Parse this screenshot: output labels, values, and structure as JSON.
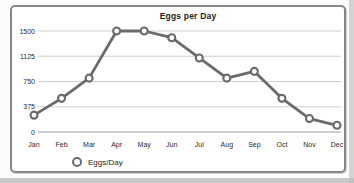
{
  "page": {
    "background": "#fcfcfa",
    "scan_edge_color": "#c2c2c0"
  },
  "chart": {
    "title": "Eggs per Day",
    "legend_label": "Eggs/Day"
  },
  "chart_data": {
    "type": "line",
    "title": "Eggs per Day",
    "categories": [
      "Jan",
      "Feb",
      "Mar",
      "Apr",
      "May",
      "Jun",
      "Jul",
      "Aug",
      "Sep",
      "Oct",
      "Nov",
      "Dec"
    ],
    "series": [
      {
        "name": "Eggs/Day",
        "values": [
          250,
          500,
          800,
          1500,
          1500,
          1400,
          1100,
          800,
          900,
          500,
          200,
          100
        ]
      }
    ],
    "xlabel": "",
    "ylabel": "",
    "ylim": [
      0,
      1500
    ],
    "yticks": [
      0,
      375,
      750,
      1125,
      1500
    ],
    "grid": true,
    "legend_position": "bottom-left",
    "marker": "open-circle",
    "colors": {
      "line": "#6a6a6a",
      "marker_fill": "#ffffff",
      "gridline": "#cfcfcf",
      "axis_line": "#9b9b9b",
      "text": "#2a2a2a",
      "frame_border": "#868686"
    }
  }
}
